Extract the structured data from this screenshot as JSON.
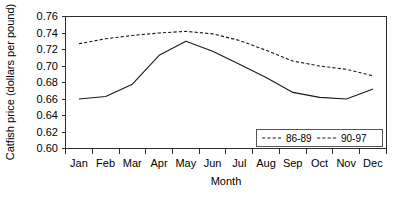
{
  "chart_data": {
    "type": "line",
    "title": "",
    "xlabel": "Month",
    "ylabel": "Catfish price (dollars per pound)",
    "categories": [
      "Jan",
      "Feb",
      "Mar",
      "Apr",
      "May",
      "Jun",
      "Jul",
      "Aug",
      "Sep",
      "Oct",
      "Nov",
      "Dec"
    ],
    "ylim": [
      0.6,
      0.76
    ],
    "yticks": [
      "0.60",
      "0.62",
      "0.64",
      "0.66",
      "0.68",
      "0.70",
      "0.72",
      "0.74",
      "0.76"
    ],
    "ytick_values": [
      0.6,
      0.62,
      0.64,
      0.66,
      0.68,
      0.7,
      0.72,
      0.74,
      0.76
    ],
    "grid": false,
    "legend_position": "bottom-right",
    "series": [
      {
        "name": "86-89",
        "style": "solid",
        "values": [
          0.66,
          0.663,
          0.678,
          0.713,
          0.73,
          0.718,
          0.702,
          0.686,
          0.668,
          0.662,
          0.66,
          0.672
        ]
      },
      {
        "name": "90-97",
        "style": "dashed",
        "values": [
          0.727,
          0.733,
          0.737,
          0.74,
          0.742,
          0.739,
          0.731,
          0.719,
          0.706,
          0.7,
          0.696,
          0.688
        ]
      }
    ]
  },
  "axis": {
    "y_label": "Catfish price (dollars per pound)",
    "x_label": "Month"
  },
  "legend": {
    "entries": [
      {
        "label": "86-89",
        "style": "dashed-swatch"
      },
      {
        "label": "90-97",
        "style": "dashed-swatch"
      }
    ]
  }
}
